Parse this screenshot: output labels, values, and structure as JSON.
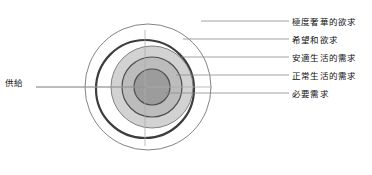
{
  "diagram": {
    "type": "concentric-rings",
    "title": "",
    "center": {
      "x": 148,
      "y": 87
    },
    "supply_label": "供給",
    "supply_leader": {
      "from_x": 36,
      "to_x": 148,
      "y": 87
    },
    "rings": [
      {
        "id": "extreme-luxury",
        "label": "極度奢華的欲求",
        "radius": 63,
        "cx": 148,
        "cy": 87,
        "fill": "#ffffff",
        "stroke": "#6f6f6f",
        "stroke_width": 0.9,
        "leader_y": 21,
        "leader_from_x": 201,
        "leader_to_x": 288
      },
      {
        "id": "hopes-and-desires",
        "label": "希望和欲求",
        "radius": 49,
        "cx": 145,
        "cy": 89,
        "fill": "#ffffff",
        "stroke": "#3a3a3a",
        "stroke_width": 2.1,
        "leader_y": 39,
        "leader_from_x": 182,
        "leader_to_x": 288
      },
      {
        "id": "comfortable-living",
        "label": "安適生活的需求",
        "radius": 41,
        "cx": 152,
        "cy": 87,
        "fill": "#d0d0d0",
        "stroke": "#6f6f6f",
        "stroke_width": 0.9,
        "leader_y": 57,
        "leader_from_x": 180,
        "leader_to_x": 288
      },
      {
        "id": "normal-living",
        "label": "正常生活的需求",
        "radius": 30,
        "cx": 152,
        "cy": 87,
        "fill": "#b8b8b8",
        "stroke": "#4a4a4a",
        "stroke_width": 1.2,
        "leader_y": 75,
        "leader_from_x": 175,
        "leader_to_x": 288
      },
      {
        "id": "essential-needs",
        "label": "必要需求",
        "radius": 18,
        "cx": 152,
        "cy": 87,
        "fill": "#9a9a9a",
        "stroke": "#4a4a4a",
        "stroke_width": 1.2,
        "leader_y": 93,
        "leader_from_x": 164,
        "leader_to_x": 288
      }
    ],
    "crosshair": {
      "color": "#a8a8a8",
      "vertical": {
        "x": 145,
        "y1": 30,
        "y2": 145
      },
      "horizontal": {
        "y": 87,
        "x1": 36,
        "x2": 212
      }
    },
    "leader_color": "#8a8a8a"
  }
}
